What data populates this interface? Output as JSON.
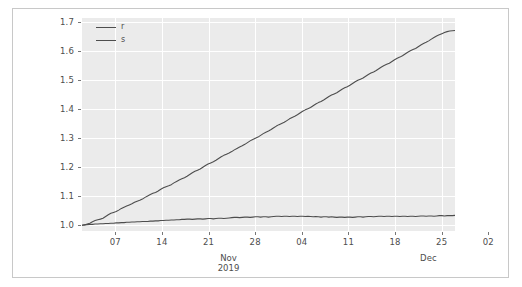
{
  "chart_data": {
    "type": "line",
    "title": "",
    "xlabel": "",
    "ylabel": "",
    "ylim": [
      0.98,
      1.715
    ],
    "xlim": [
      0,
      56
    ],
    "grid": true,
    "legend_position": "top-left-inside",
    "background": "#ebebeb",
    "gridline_color": "#ffffff",
    "yticks": [
      "1.0",
      "1.1",
      "1.2",
      "1.3",
      "1.4",
      "1.5",
      "1.6",
      "1.7"
    ],
    "ytick_values": [
      1.0,
      1.1,
      1.2,
      1.3,
      1.4,
      1.5,
      1.6,
      1.7
    ],
    "xticks": [
      "07",
      "14",
      "21",
      "28",
      "04",
      "11",
      "18",
      "25",
      "02",
      "09",
      "16"
    ],
    "xtick_values": [
      5,
      12,
      19,
      26,
      33,
      40,
      47,
      54,
      61,
      68,
      75
    ],
    "month_labels": [
      {
        "line1": "Nov",
        "line2": "2019",
        "x": 22
      },
      {
        "line1": "Dec",
        "line2": "",
        "x": 52
      }
    ],
    "series": [
      {
        "name": "r",
        "color": "#4d4d4d",
        "values": [
          1.0,
          1.001,
          1.004,
          1.007,
          1.012,
          1.016,
          1.019,
          1.021,
          1.024,
          1.03,
          1.036,
          1.041,
          1.044,
          1.047,
          1.052,
          1.058,
          1.062,
          1.066,
          1.07,
          1.074,
          1.079,
          1.083,
          1.086,
          1.09,
          1.096,
          1.101,
          1.106,
          1.11,
          1.113,
          1.118,
          1.124,
          1.129,
          1.133,
          1.136,
          1.14,
          1.146,
          1.151,
          1.156,
          1.16,
          1.164,
          1.169,
          1.175,
          1.181,
          1.186,
          1.19,
          1.194,
          1.2,
          1.206,
          1.211,
          1.215,
          1.219,
          1.224,
          1.23,
          1.236,
          1.241,
          1.245,
          1.249,
          1.254,
          1.26,
          1.265,
          1.27,
          1.274,
          1.279,
          1.285,
          1.291,
          1.296,
          1.3,
          1.304,
          1.31,
          1.316,
          1.321,
          1.325,
          1.33,
          1.336,
          1.342,
          1.347,
          1.351,
          1.355,
          1.361,
          1.367,
          1.372,
          1.376,
          1.381,
          1.387,
          1.393,
          1.398,
          1.402,
          1.406,
          1.412,
          1.418,
          1.423,
          1.427,
          1.432,
          1.438,
          1.444,
          1.449,
          1.453,
          1.457,
          1.463,
          1.469,
          1.474,
          1.478,
          1.483,
          1.489,
          1.495,
          1.5,
          1.504,
          1.508,
          1.514,
          1.52,
          1.525,
          1.529,
          1.534,
          1.54,
          1.546,
          1.551,
          1.555,
          1.559,
          1.565,
          1.571,
          1.576,
          1.58,
          1.585,
          1.591,
          1.597,
          1.602,
          1.606,
          1.61,
          1.616,
          1.622,
          1.627,
          1.631,
          1.636,
          1.642,
          1.648,
          1.653,
          1.657,
          1.661,
          1.665,
          1.668,
          1.67,
          1.671,
          1.672
        ]
      },
      {
        "name": "s",
        "color": "#4d4d4d",
        "values": [
          1.0,
          1.001,
          1.002,
          1.003,
          1.003,
          1.004,
          1.004,
          1.005,
          1.005,
          1.006,
          1.006,
          1.007,
          1.007,
          1.008,
          1.008,
          1.009,
          1.009,
          1.01,
          1.01,
          1.011,
          1.011,
          1.012,
          1.012,
          1.013,
          1.013,
          1.013,
          1.014,
          1.014,
          1.015,
          1.015,
          1.016,
          1.016,
          1.017,
          1.017,
          1.018,
          1.018,
          1.019,
          1.019,
          1.02,
          1.02,
          1.021,
          1.021,
          1.02,
          1.021,
          1.022,
          1.022,
          1.021,
          1.022,
          1.023,
          1.023,
          1.022,
          1.023,
          1.024,
          1.024,
          1.023,
          1.024,
          1.025,
          1.026,
          1.027,
          1.027,
          1.026,
          1.027,
          1.028,
          1.028,
          1.027,
          1.028,
          1.029,
          1.029,
          1.028,
          1.029,
          1.029,
          1.028,
          1.029,
          1.03,
          1.031,
          1.031,
          1.03,
          1.031,
          1.031,
          1.03,
          1.031,
          1.031,
          1.03,
          1.031,
          1.031,
          1.03,
          1.031,
          1.03,
          1.029,
          1.03,
          1.029,
          1.028,
          1.029,
          1.029,
          1.028,
          1.029,
          1.028,
          1.027,
          1.028,
          1.028,
          1.027,
          1.028,
          1.028,
          1.027,
          1.028,
          1.029,
          1.029,
          1.028,
          1.029,
          1.03,
          1.03,
          1.029,
          1.03,
          1.031,
          1.031,
          1.03,
          1.031,
          1.031,
          1.03,
          1.031,
          1.031,
          1.03,
          1.031,
          1.031,
          1.03,
          1.031,
          1.031,
          1.03,
          1.031,
          1.032,
          1.032,
          1.031,
          1.032,
          1.032,
          1.031,
          1.032,
          1.033,
          1.033,
          1.032,
          1.033,
          1.033,
          1.033,
          1.034
        ]
      }
    ]
  },
  "legend": {
    "entries": [
      {
        "label": "r",
        "color": "#4d4d4d"
      },
      {
        "label": "s",
        "color": "#4d4d4d"
      }
    ]
  }
}
